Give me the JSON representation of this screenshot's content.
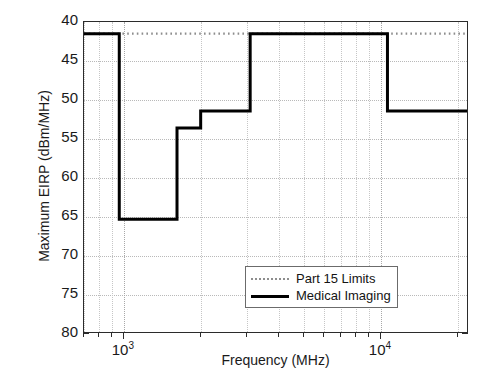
{
  "chart_data": {
    "type": "line",
    "title": "",
    "xlabel": "Frequency  (MHz)",
    "ylabel": "Maximum EIRP (dBm/MHz)",
    "xscale": "log",
    "xlim": [
      700,
      22000
    ],
    "ylim": [
      40,
      80
    ],
    "y_axis_inverted": true,
    "grid": true,
    "legend_position": "lower right",
    "xticks": [
      {
        "value": 1000,
        "label": "10",
        "exponent": "3"
      },
      {
        "value": 10000,
        "label": "10",
        "exponent": "4"
      }
    ],
    "yticks": [
      40,
      45,
      50,
      55,
      60,
      65,
      70,
      75,
      80
    ],
    "series": [
      {
        "name": "Part 15 Limits",
        "style": "dotted",
        "color": "#8d8d8d",
        "step_points": [
          {
            "f": 700,
            "eirp": 41.5
          },
          {
            "f": 22000,
            "eirp": 41.5
          }
        ]
      },
      {
        "name": "Medical Imaging",
        "style": "solid",
        "color": "#000000",
        "step_points": [
          {
            "f": 700,
            "eirp": 41.5
          },
          {
            "f": 960,
            "eirp": 41.5
          },
          {
            "f": 960,
            "eirp": 65.3
          },
          {
            "f": 1610,
            "eirp": 65.3
          },
          {
            "f": 1610,
            "eirp": 53.6
          },
          {
            "f": 1990,
            "eirp": 53.6
          },
          {
            "f": 1990,
            "eirp": 51.4
          },
          {
            "f": 3100,
            "eirp": 51.4
          },
          {
            "f": 3100,
            "eirp": 41.5
          },
          {
            "f": 10600,
            "eirp": 41.5
          },
          {
            "f": 10600,
            "eirp": 51.4
          },
          {
            "f": 22000,
            "eirp": 51.4
          }
        ]
      }
    ]
  },
  "legend": {
    "entries": [
      {
        "label": "Part 15 Limits"
      },
      {
        "label": "Medical Imaging"
      }
    ]
  },
  "colors": {
    "axis": "#2b2b2b",
    "grid": "#b9b9b9",
    "part15": "#8d8d8d",
    "medical": "#000000",
    "background": "#ffffff"
  }
}
